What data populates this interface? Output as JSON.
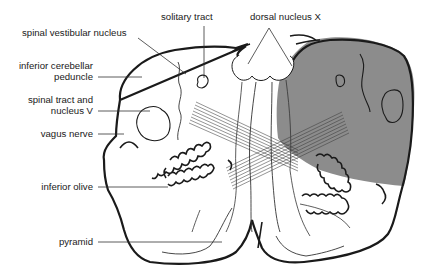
{
  "diagram": {
    "colors": {
      "outline": "#1a1a1a",
      "shaded_region": "#8c8c8c",
      "fibers": "#3a3a3a",
      "background": "#ffffff"
    },
    "labels": {
      "spinal_vestibular_nucleus": "spinal vestibular nucleus",
      "solitary_tract": "solitary tract",
      "dorsal_nucleus_x": "dorsal nucleus X",
      "inferior_cerebellar_peduncle_1": "inferior cerebellar",
      "inferior_cerebellar_peduncle_2": "peduncle",
      "spinal_tract_1": "spinal tract and",
      "spinal_tract_2": "nucleus V",
      "vagus_nerve": "vagus nerve",
      "inferior_olive": "inferior olive",
      "pyramid": "pyramid"
    }
  }
}
